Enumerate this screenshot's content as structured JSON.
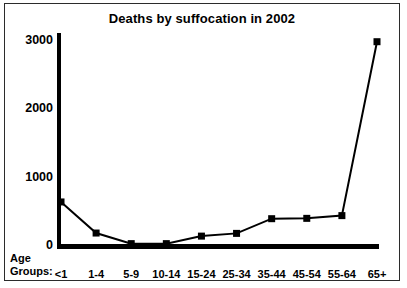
{
  "chart_data": {
    "type": "line",
    "title": "Deaths by suffocation in 2002",
    "xlabel": "Age Groups:",
    "ylabel": "",
    "categories": [
      "<1",
      "1-4",
      "5-9",
      "10-14",
      "15-24",
      "25-34",
      "35-44",
      "45-54",
      "55-64",
      "65+"
    ],
    "values": [
      630,
      175,
      20,
      20,
      130,
      170,
      385,
      390,
      430,
      2975
    ],
    "yticks": [
      0,
      1000,
      2000,
      3000
    ],
    "ylim": [
      0,
      3000
    ],
    "grid": false,
    "legend": false,
    "marker": "square",
    "series_color": "#000000",
    "background_color": "#ffffff",
    "border_color": "#2b2b2b"
  },
  "axis_caption": {
    "line1": "Age",
    "line2": "Groups:"
  }
}
